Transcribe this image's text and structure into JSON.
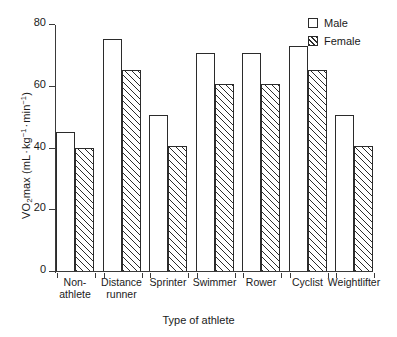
{
  "chart_data": {
    "type": "bar",
    "title": "",
    "xlabel": "Type of athlete",
    "ylabel": "VO2max (mL . kg-1 . min-1)",
    "ylabel_parts": {
      "prefix": "VO",
      "sub": "2",
      "mid": "max (mL",
      "unit1_base": "kg",
      "unit1_exp": "−1",
      "unit2_base": "min",
      "unit2_exp": "−1",
      "suffix": ")",
      "separator": "·"
    },
    "categories": [
      "Non-\nathlete",
      "Distance\nrunner",
      "Sprinter",
      "Swimmer",
      "Rower",
      "Cyclist",
      "Weightlifter"
    ],
    "series": [
      {
        "name": "Male",
        "fill": "open",
        "values": [
          45,
          75,
          50.5,
          70.5,
          70.5,
          73,
          50.5
        ]
      },
      {
        "name": "Female",
        "fill": "hatched",
        "values": [
          40,
          65,
          40.5,
          60.5,
          60.5,
          65,
          40.5
        ]
      }
    ],
    "ylim": [
      0,
      80
    ],
    "yticks": [
      0,
      20,
      40,
      60,
      80
    ],
    "ytick_labels": [
      "0",
      "20",
      "40",
      "60",
      "80"
    ],
    "grid": false,
    "legend_position": "top-right",
    "colors": {
      "axis": "#3a3a3a",
      "bar_outline": "#2b2b2b",
      "bar_fill_male": "#ffffff",
      "bar_fill_female": "#ffffff",
      "hatch": "#2b2b2b",
      "text": "#1a1a1a",
      "background": "#ffffff"
    }
  }
}
